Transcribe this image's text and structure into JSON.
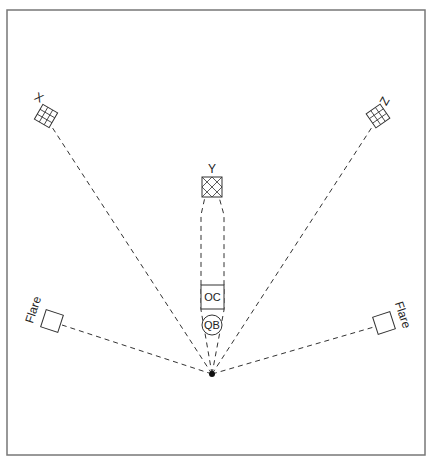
{
  "diagram": {
    "title": "",
    "labels": {
      "x": "X",
      "y": "Y",
      "z": "Z",
      "flare_left": "Flare",
      "flare_right": "Flare",
      "oc": "OC",
      "qb": "QB"
    },
    "nodes": [
      {
        "id": "x",
        "label": "X",
        "shape": "hatched-square",
        "cx": 46,
        "cy": 116
      },
      {
        "id": "z",
        "label": "Z",
        "shape": "hatched-square",
        "cx": 378,
        "cy": 116
      },
      {
        "id": "y",
        "label": "Y",
        "shape": "hatched-square",
        "cx": 212,
        "cy": 187
      },
      {
        "id": "flare_left",
        "label": "Flare",
        "shape": "square",
        "cx": 52,
        "cy": 321
      },
      {
        "id": "flare_right",
        "label": "Flare",
        "shape": "square",
        "cx": 384,
        "cy": 323
      },
      {
        "id": "oc",
        "label": "OC",
        "shape": "square",
        "cx": 212,
        "cy": 297
      },
      {
        "id": "qb",
        "label": "QB",
        "shape": "circle",
        "cx": 212,
        "cy": 325
      },
      {
        "id": "ball",
        "label": "",
        "shape": "dot",
        "cx": 212,
        "cy": 374
      }
    ],
    "routes": [
      {
        "from": "ball",
        "to": "x",
        "style": "dashed"
      },
      {
        "from": "ball",
        "to": "z",
        "style": "dashed"
      },
      {
        "from": "ball",
        "to": "flare_left",
        "style": "dashed"
      },
      {
        "from": "ball",
        "to": "flare_right",
        "style": "dashed"
      },
      {
        "from": "ball",
        "to": "y",
        "style": "dashed",
        "note": "two parallel lanes around OC/QB"
      }
    ]
  }
}
